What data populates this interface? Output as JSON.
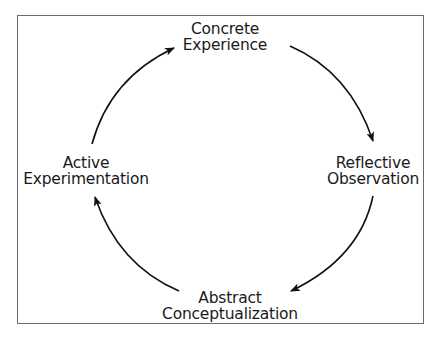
{
  "diagram": {
    "nodes": [
      {
        "id": "concrete",
        "line1": "Concrete",
        "line2": "Experience"
      },
      {
        "id": "reflective",
        "line1": "Reflective",
        "line2": "Observation"
      },
      {
        "id": "abstract",
        "line1": "Abstract",
        "line2": "Conceptualization"
      },
      {
        "id": "active",
        "line1": "Active",
        "line2": "Experimentation"
      }
    ],
    "edges": [
      {
        "from": "concrete",
        "to": "reflective",
        "direction": "clockwise"
      },
      {
        "from": "reflective",
        "to": "abstract",
        "direction": "clockwise"
      },
      {
        "from": "abstract",
        "to": "active",
        "direction": "clockwise"
      },
      {
        "from": "active",
        "to": "concrete",
        "direction": "clockwise"
      }
    ],
    "colors": {
      "stroke": "#111111",
      "frame": "#6b6b6b",
      "text": "#1a1a1a",
      "background": "#ffffff"
    }
  }
}
